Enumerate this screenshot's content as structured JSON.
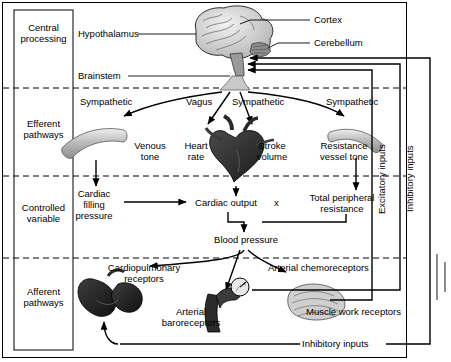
{
  "diagram": {
    "stages": [
      {
        "id": "central-processing",
        "label": "Central\nprocessing"
      },
      {
        "id": "efferent-pathways",
        "label": "Efferent\npathways"
      },
      {
        "id": "controlled-variable",
        "label": "Controlled\nvariable"
      },
      {
        "id": "afferent-pathways",
        "label": "Afferent\npathways"
      }
    ],
    "labels": {
      "cortex": "Cortex",
      "hypothalamus": "Hypothalamus",
      "cerebellum": "Cerebellum",
      "brainstem": "Brainstem",
      "sympathetic_1": "Sympathetic",
      "vagus": "Vagus",
      "sympathetic_2": "Sympathetic",
      "sympathetic_3": "Sympathetic",
      "venous_tone": "Venous\ntone",
      "heart_rate": "Heart\nrate",
      "stroke_volume": "Stroke\nvolume",
      "resistance_vessel_tone": "Resistance\nvessel tone",
      "cardiac_filling_pressure": "Cardiac\nfilling\npressure",
      "cardiac_output": "Cardiac output",
      "times": "x",
      "total_peripheral_resistance": "Total peripheral\nresistance",
      "blood_pressure": "Blood pressure",
      "cardiopulmonary_receptors": "Cardiopulmonary\nreceptors",
      "arterial_chemoreceptors": "Arterial chemoreceptors",
      "arterial_baroreceptors": "Arterial\nbaroreceptors",
      "muscle_work_receptors": "Muscle work receptors",
      "excitatory_inputs": "Excitatory inputs",
      "inhibitory_inputs_vertical": "Inhibitory inputs",
      "inhibitory_inputs_bottom": "Inhibitory inputs"
    },
    "colors": {
      "line": "#000000",
      "organ_fill": "#3a3a3a",
      "vessel_fill": "#c8c8c8",
      "panel_stroke": "#000000",
      "background": "#ffffff"
    }
  }
}
